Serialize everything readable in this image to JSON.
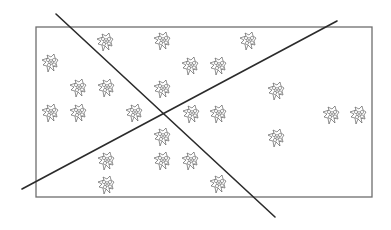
{
  "diagram": {
    "background": "#ffffff",
    "rectangle": {
      "x": 36,
      "y": 27,
      "width": 336,
      "height": 170,
      "stroke": "#6e6e6e",
      "stroke_width": 1.3
    },
    "lines": [
      {
        "name": "descending-line",
        "x1": 56,
        "y1": 14,
        "x2": 275,
        "y2": 217,
        "stroke": "#2b2b2b",
        "stroke_width": 1.6
      },
      {
        "name": "ascending-line",
        "x1": 22,
        "y1": 189,
        "x2": 337,
        "y2": 21,
        "stroke": "#2b2b2b",
        "stroke_width": 1.6
      }
    ],
    "intersection": {
      "x": 163,
      "y": 115
    },
    "flower_icon": "flower-icon",
    "flower_size": 18,
    "flowers": [
      {
        "x": 105,
        "y": 42
      },
      {
        "x": 162,
        "y": 41
      },
      {
        "x": 248,
        "y": 41
      },
      {
        "x": 50,
        "y": 63
      },
      {
        "x": 190,
        "y": 66
      },
      {
        "x": 218,
        "y": 66
      },
      {
        "x": 78,
        "y": 88
      },
      {
        "x": 106,
        "y": 88
      },
      {
        "x": 162,
        "y": 89
      },
      {
        "x": 276,
        "y": 91
      },
      {
        "x": 50,
        "y": 113
      },
      {
        "x": 78,
        "y": 113
      },
      {
        "x": 134,
        "y": 113
      },
      {
        "x": 191,
        "y": 114
      },
      {
        "x": 218,
        "y": 114
      },
      {
        "x": 331,
        "y": 115
      },
      {
        "x": 358,
        "y": 115
      },
      {
        "x": 162,
        "y": 137
      },
      {
        "x": 276,
        "y": 138
      },
      {
        "x": 106,
        "y": 161
      },
      {
        "x": 162,
        "y": 161
      },
      {
        "x": 190,
        "y": 161
      },
      {
        "x": 106,
        "y": 185
      },
      {
        "x": 218,
        "y": 184
      }
    ]
  }
}
